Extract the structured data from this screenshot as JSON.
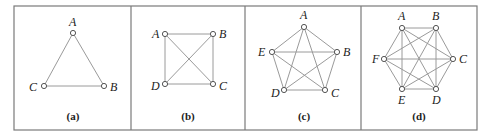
{
  "figure": {
    "panels": [
      {
        "id": "a",
        "caption": "(a)",
        "nodes": [
          {
            "label": "A",
            "x": 73,
            "y": 33,
            "lx": 69,
            "ly": 26
          },
          {
            "label": "B",
            "x": 104,
            "y": 86,
            "lx": 110,
            "ly": 91
          },
          {
            "label": "C",
            "x": 44,
            "y": 86,
            "lx": 29,
            "ly": 91
          }
        ],
        "edges": [
          [
            "A",
            "B"
          ],
          [
            "B",
            "C"
          ],
          [
            "C",
            "A"
          ]
        ],
        "caption_pos": {
          "x": 73,
          "y": 120
        }
      },
      {
        "id": "b",
        "caption": "(b)",
        "nodes": [
          {
            "label": "A",
            "x": 165,
            "y": 34,
            "lx": 152,
            "ly": 38
          },
          {
            "label": "B",
            "x": 213,
            "y": 34,
            "lx": 219,
            "ly": 38
          },
          {
            "label": "C",
            "x": 213,
            "y": 84,
            "lx": 219,
            "ly": 90
          },
          {
            "label": "D",
            "x": 165,
            "y": 84,
            "lx": 151,
            "ly": 90
          }
        ],
        "edges": [
          [
            "A",
            "B"
          ],
          [
            "B",
            "C"
          ],
          [
            "C",
            "D"
          ],
          [
            "D",
            "A"
          ],
          [
            "A",
            "C"
          ],
          [
            "B",
            "D"
          ]
        ],
        "caption_pos": {
          "x": 188,
          "y": 120
        }
      },
      {
        "id": "c",
        "caption": "(c)",
        "nodes": [
          {
            "label": "A",
            "x": 304,
            "y": 27,
            "lx": 300,
            "ly": 19
          },
          {
            "label": "B",
            "x": 337,
            "y": 52,
            "lx": 343,
            "ly": 56
          },
          {
            "label": "C",
            "x": 325,
            "y": 90,
            "lx": 331,
            "ly": 97
          },
          {
            "label": "D",
            "x": 284,
            "y": 90,
            "lx": 271,
            "ly": 97
          },
          {
            "label": "E",
            "x": 272,
            "y": 52,
            "lx": 258,
            "ly": 56
          }
        ],
        "edges": [
          [
            "A",
            "B"
          ],
          [
            "A",
            "C"
          ],
          [
            "A",
            "D"
          ],
          [
            "A",
            "E"
          ],
          [
            "B",
            "C"
          ],
          [
            "B",
            "D"
          ],
          [
            "B",
            "E"
          ],
          [
            "C",
            "D"
          ],
          [
            "C",
            "E"
          ],
          [
            "D",
            "E"
          ]
        ],
        "caption_pos": {
          "x": 304,
          "y": 120
        }
      },
      {
        "id": "d",
        "caption": "(d)",
        "nodes": [
          {
            "label": "A",
            "x": 402,
            "y": 28,
            "lx": 398,
            "ly": 20
          },
          {
            "label": "B",
            "x": 436,
            "y": 28,
            "lx": 432,
            "ly": 20
          },
          {
            "label": "C",
            "x": 453,
            "y": 59,
            "lx": 459,
            "ly": 63
          },
          {
            "label": "D",
            "x": 436,
            "y": 89,
            "lx": 432,
            "ly": 104
          },
          {
            "label": "E",
            "x": 402,
            "y": 89,
            "lx": 398,
            "ly": 104
          },
          {
            "label": "F",
            "x": 384,
            "y": 59,
            "lx": 372,
            "ly": 63
          }
        ],
        "edges": [
          [
            "A",
            "B"
          ],
          [
            "A",
            "C"
          ],
          [
            "A",
            "D"
          ],
          [
            "A",
            "E"
          ],
          [
            "A",
            "F"
          ],
          [
            "B",
            "C"
          ],
          [
            "B",
            "D"
          ],
          [
            "B",
            "E"
          ],
          [
            "B",
            "F"
          ],
          [
            "C",
            "D"
          ],
          [
            "C",
            "E"
          ],
          [
            "C",
            "F"
          ],
          [
            "D",
            "E"
          ],
          [
            "D",
            "F"
          ],
          [
            "E",
            "F"
          ]
        ],
        "caption_pos": {
          "x": 419,
          "y": 120
        }
      }
    ],
    "frame": {
      "x": 14,
      "y": 6,
      "width": 463,
      "height": 124
    },
    "dividers": [
      131,
      245,
      361
    ]
  }
}
